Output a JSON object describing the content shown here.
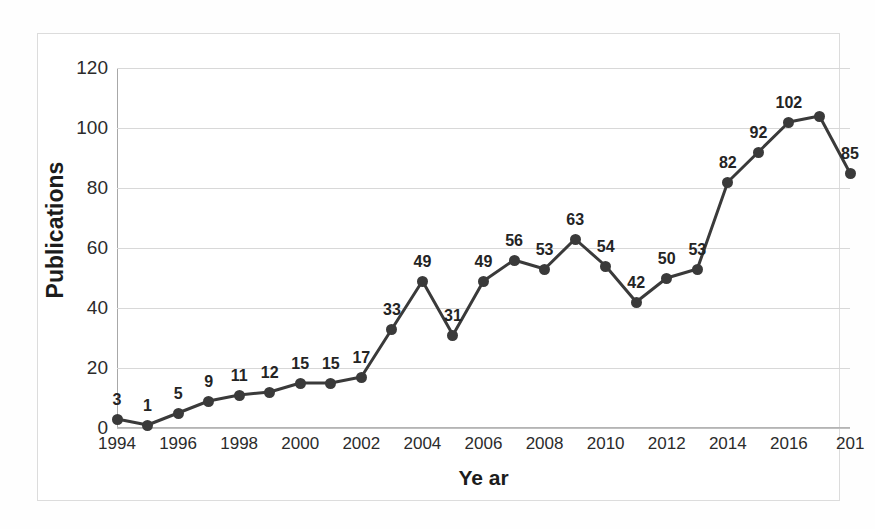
{
  "chart_data": {
    "type": "line",
    "title": "",
    "xlabel": "Ye ar",
    "ylabel": "Publications",
    "x": [
      1994,
      1995,
      1996,
      1997,
      1998,
      1999,
      2000,
      2001,
      2002,
      2003,
      2004,
      2005,
      2006,
      2007,
      2008,
      2009,
      2010,
      2011,
      2012,
      2013,
      2014,
      2015,
      2016,
      2017,
      2018
    ],
    "values": [
      3,
      1,
      5,
      9,
      11,
      12,
      15,
      15,
      17,
      33,
      49,
      31,
      49,
      56,
      53,
      63,
      54,
      42,
      50,
      53,
      82,
      92,
      102,
      104,
      85
    ],
    "point_labels": [
      "3",
      "1",
      "5",
      "9",
      "11",
      "12",
      "15",
      "15",
      "17",
      "33",
      "49",
      "31",
      "49",
      "56",
      "53",
      "63",
      "54",
      "42",
      "50",
      "53",
      "82",
      "92",
      "102",
      "",
      "85"
    ],
    "ylim": [
      0,
      120
    ],
    "xlim": [
      1994,
      2018
    ],
    "ytick_labels": [
      "0",
      "20",
      "40",
      "60",
      "80",
      "100",
      "120"
    ],
    "ytick_values": [
      0,
      20,
      40,
      60,
      80,
      100,
      120
    ],
    "xtick_labels": [
      "1994",
      "1996",
      "1998",
      "2000",
      "2002",
      "2004",
      "2006",
      "2008",
      "2010",
      "2012",
      "2014",
      "2016",
      "201"
    ],
    "xtick_values": [
      1994,
      1996,
      1998,
      2000,
      2002,
      2004,
      2006,
      2008,
      2010,
      2012,
      2014,
      2016,
      2018
    ],
    "grid": true,
    "legend": "none",
    "series_name": "Publications",
    "line_color": "#3a3a3a",
    "marker_color": "#3a3a3a",
    "grid_color": "#d8d8d8",
    "background_color": "#ffffff",
    "text_color": "#242424"
  }
}
